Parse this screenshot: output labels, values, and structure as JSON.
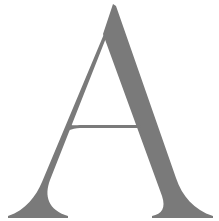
{
  "glyph": {
    "character": "A",
    "style": "serif",
    "color": "#7a7a7a",
    "background": "#ffffff"
  }
}
